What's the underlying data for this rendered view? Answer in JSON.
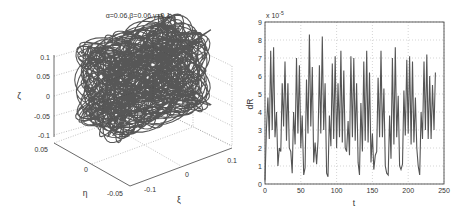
{
  "figure": {
    "left": {
      "title": "α=0.06,β=0.06,γ=0.1",
      "zlabel": "ζ",
      "ylabel": "η",
      "xlabel": "ξ",
      "zticks": [
        "0.1",
        "0.05",
        "0",
        "-0.05",
        "-0.1"
      ],
      "eta_ticks": [
        "0.05",
        "0",
        "-0.05"
      ],
      "xi_ticks": [
        "-0.1",
        "0",
        "0.1"
      ]
    },
    "right": {
      "ylabel": "dR",
      "xlabel": "t",
      "exponent_label": "x 10",
      "exponent": "-5",
      "yticks": [
        "0",
        "1",
        "2",
        "3",
        "4",
        "5",
        "6",
        "7",
        "8",
        "9"
      ],
      "xticks": [
        "0",
        "50",
        "100",
        "150",
        "200",
        "250"
      ]
    }
  },
  "chart_data": [
    {
      "type": "line3d",
      "title": "α=0.06,β=0.06,γ=0.1",
      "xlabel": "ξ",
      "ylabel": "η",
      "zlabel": "ζ",
      "xlim": [
        -0.1,
        0.1
      ],
      "ylim": [
        -0.05,
        0.05
      ],
      "zlim": [
        -0.1,
        0.1
      ],
      "grid": true,
      "description": "Dense quasi-periodic 3D trajectory filling a roughly ellipsoidal region within ξ∈[-0.1,0.1], η∈[-0.05,0.05], ζ∈[-0.1,0.1]"
    },
    {
      "type": "line",
      "title": "",
      "xlabel": "t",
      "ylabel": "dR",
      "y_scale_factor": "x 10^-5",
      "xlim": [
        0,
        250
      ],
      "ylim": [
        0,
        9
      ],
      "grid": true,
      "x": [
        0,
        2,
        4,
        6,
        8,
        10,
        12,
        14,
        16,
        18,
        20,
        22,
        24,
        26,
        28,
        30,
        32,
        34,
        36,
        38,
        40,
        42,
        44,
        46,
        48,
        50,
        52,
        54,
        56,
        58,
        60,
        62,
        64,
        66,
        68,
        70,
        72,
        74,
        76,
        78,
        80,
        82,
        84,
        86,
        88,
        90,
        92,
        94,
        96,
        98,
        100,
        102,
        104,
        106,
        108,
        110,
        112,
        114,
        116,
        118,
        120,
        122,
        124,
        126,
        128,
        130,
        132,
        134,
        136,
        138,
        140,
        142,
        144,
        146,
        148,
        150,
        152,
        154,
        156,
        158,
        160,
        162,
        164,
        166,
        168,
        170,
        172,
        174,
        176,
        178,
        180,
        182,
        184,
        186,
        188,
        190,
        192,
        194,
        196,
        198,
        200,
        202,
        204,
        206,
        208,
        210,
        212,
        214,
        216,
        218,
        220,
        222,
        224,
        226,
        228,
        230,
        232,
        234,
        236,
        238,
        240,
        242,
        244,
        246,
        248,
        250
      ],
      "values": [
        0.2,
        3.0,
        4.8,
        2.5,
        7.4,
        3.0,
        7.6,
        2.6,
        4.0,
        1.0,
        2.0,
        1.8,
        5.6,
        3.2,
        6.8,
        2.4,
        5.6,
        2.0,
        1.8,
        0.6,
        4.0,
        2.2,
        7.0,
        2.8,
        6.6,
        2.0,
        3.8,
        0.5,
        0.9,
        5.8,
        2.8,
        8.3,
        3.2,
        6.5,
        1.2,
        2.3,
        1.1,
        2.4,
        6.6,
        2.8,
        8.2,
        3.0,
        5.6,
        0.6,
        0.4,
        3.8,
        2.1,
        6.7,
        2.5,
        7.1,
        2.0,
        5.6,
        2.6,
        7.4,
        2.3,
        6.3,
        2.0,
        1.8,
        3.5,
        1.6,
        7.1,
        2.6,
        7.0,
        2.4,
        5.6,
        1.2,
        0.5,
        4.5,
        1.8,
        6.8,
        2.4,
        7.4,
        2.3,
        6.2,
        1.2,
        2.8,
        0.8,
        1.6,
        1.8,
        5.9,
        2.6,
        7.4,
        2.6,
        5.3,
        1.0,
        0.6,
        0.5,
        3.8,
        1.4,
        7.0,
        2.2,
        7.6,
        2.6,
        4.9,
        1.0,
        0.8,
        1.1,
        5.2,
        2.7,
        6.9,
        2.8,
        7.1,
        2.2,
        6.8,
        2.3,
        4.8,
        2.0,
        1.0,
        0.5,
        4.0,
        2.5,
        6.8,
        3.0,
        7.2,
        2.5,
        6.0,
        2.5,
        5.5,
        3.0,
        6.2
      ],
      "categories": []
    }
  ]
}
